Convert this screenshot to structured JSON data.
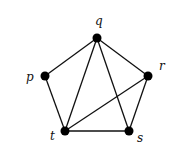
{
  "diagram": {
    "type": "graph",
    "nodes": [
      {
        "id": "q",
        "label": "q",
        "x": 97,
        "y": 38,
        "lx": 95,
        "ly": 25
      },
      {
        "id": "p",
        "label": "p",
        "x": 45,
        "y": 76,
        "lx": 26,
        "ly": 81
      },
      {
        "id": "r",
        "label": "r",
        "x": 148,
        "y": 76,
        "lx": 159,
        "ly": 70
      },
      {
        "id": "t",
        "label": "t",
        "x": 65,
        "y": 131,
        "lx": 50,
        "ly": 140
      },
      {
        "id": "s",
        "label": "s",
        "x": 129,
        "y": 131,
        "lx": 137,
        "ly": 142
      }
    ],
    "edges": [
      [
        "p",
        "q"
      ],
      [
        "q",
        "r"
      ],
      [
        "p",
        "t"
      ],
      [
        "q",
        "t"
      ],
      [
        "q",
        "s"
      ],
      [
        "r",
        "t"
      ],
      [
        "r",
        "s"
      ],
      [
        "t",
        "s"
      ]
    ]
  }
}
